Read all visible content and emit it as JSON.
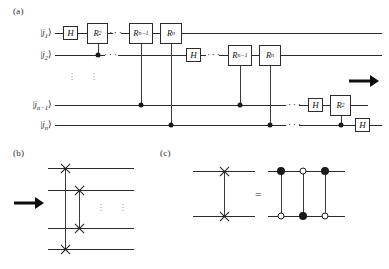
{
  "figure": {
    "panels": [
      {
        "id": "a",
        "label": "(a)"
      },
      {
        "id": "b",
        "label": "(b)"
      },
      {
        "id": "c",
        "label": "(c)"
      }
    ]
  },
  "panel_a": {
    "label": "(a)",
    "wires": [
      {
        "id": "j1",
        "label_html": "|<i>j</i><sub>1</sub>&#10217;",
        "y": 33
      },
      {
        "id": "j2",
        "label_html": "|<i>j</i><sub>2</sub>&#10217;",
        "y": 55
      },
      {
        "id": "jn1",
        "label_html": "|<i>j</i><sub>n&#8722;1</sub>&#10217;",
        "y": 105
      },
      {
        "id": "jn",
        "label_html": "|<i>j</i><sub>n</sub>&#10217;",
        "y": 125
      }
    ],
    "gates": [
      {
        "name": "h-gate-j1",
        "text_html": "H",
        "wire": "j1",
        "x": 63,
        "w": 15,
        "h": 14,
        "kind": "h"
      },
      {
        "name": "r2-gate-j1",
        "text_html": "R<sub>2</sub>",
        "wire": "j1",
        "x": 87,
        "w": 21,
        "h": 21,
        "kind": "r"
      },
      {
        "name": "rn-1-gate-j1",
        "text_html": "R<sub>n&#8722;1</sub>",
        "wire": "j1",
        "x": 129,
        "w": 24,
        "h": 21,
        "kind": "r"
      },
      {
        "name": "rn-gate-j1",
        "text_html": "R<sub>n</sub>",
        "wire": "j1",
        "x": 160,
        "w": 22,
        "h": 21,
        "kind": "r"
      },
      {
        "name": "h-gate-j2",
        "text_html": "H",
        "wire": "j2",
        "x": 186,
        "w": 15,
        "h": 14,
        "kind": "h"
      },
      {
        "name": "rn-1-gate-j2",
        "text_html": "R<sub>n&#8722;1</sub>",
        "wire": "j2",
        "x": 228,
        "w": 24,
        "h": 21,
        "kind": "r"
      },
      {
        "name": "rn-gate-j2",
        "text_html": "R<sub>n</sub>",
        "wire": "j2",
        "x": 259,
        "w": 22,
        "h": 21,
        "kind": "r"
      },
      {
        "name": "h-gate-jn-1",
        "text_html": "H",
        "wire": "jn1",
        "x": 308,
        "w": 15,
        "h": 14,
        "kind": "h"
      },
      {
        "name": "r2-gate-jn-1",
        "text_html": "R<sub>2</sub>",
        "wire": "jn1",
        "x": 330,
        "w": 21,
        "h": 21,
        "kind": "r"
      },
      {
        "name": "h-gate-jn",
        "text_html": "H",
        "wire": "jn",
        "x": 355,
        "w": 15,
        "h": 14,
        "kind": "h"
      }
    ],
    "controls": [
      {
        "name": "control-r2-j1",
        "x": 97.5,
        "wire": "j2"
      },
      {
        "name": "control-rn-1-j1",
        "x": 141,
        "wire": "jn1"
      },
      {
        "name": "control-rn-j1",
        "x": 171,
        "wire": "jn"
      },
      {
        "name": "control-rn-1-j2",
        "x": 240,
        "wire": "jn1"
      },
      {
        "name": "control-rn-j2",
        "x": 270,
        "wire": "jn"
      },
      {
        "name": "control-r2-jn-1",
        "x": 340.5,
        "wire": "jn"
      }
    ],
    "ellipses": [
      {
        "name": "h-ellipsis-j1",
        "text": "···",
        "x": 111,
        "y": 33
      },
      {
        "name": "h-ellipsis-j2",
        "text": "···",
        "x": 111,
        "y": 55
      },
      {
        "name": "h-ellipsis-j2b",
        "text": "···",
        "x": 210,
        "y": 55
      },
      {
        "name": "h-ellipsis-jn-1",
        "text": "···",
        "x": 292,
        "y": 105
      },
      {
        "name": "h-ellipsis-jn",
        "text": "···",
        "x": 292,
        "y": 125
      },
      {
        "name": "v-ellipsis-left",
        "text": "vdots",
        "x": 72,
        "y": 78
      },
      {
        "name": "v-ellipsis-right",
        "text": "vdots",
        "x": 94,
        "y": 78
      }
    ],
    "arrow": {
      "name": "flow-arrow-a",
      "x": 349,
      "y": 81,
      "length": 30
    }
  },
  "panel_b": {
    "label": "(b)",
    "wires_y": [
      168,
      190,
      228,
      249
    ],
    "swaps": [
      {
        "name": "swap-outer",
        "x": 65,
        "from_y": 168,
        "to_y": 249
      },
      {
        "name": "swap-inner",
        "x": 79,
        "from_y": 190,
        "to_y": 228
      }
    ],
    "ellipses": [
      {
        "name": "v-ellipsis-b-left",
        "x": 101,
        "y": 208
      },
      {
        "name": "v-ellipsis-b-right",
        "x": 123,
        "y": 208
      }
    ],
    "arrow": {
      "name": "flow-arrow-b",
      "x": 14,
      "y": 203,
      "length": 30
    }
  },
  "panel_c": {
    "label": "(c)",
    "wires_y": [
      171,
      216
    ],
    "swap": {
      "name": "swap-gate-c",
      "x": 224,
      "from_y": 171,
      "to_y": 216
    },
    "equals": {
      "name": "equals-sign",
      "text": "=",
      "x": 258,
      "y": 194
    },
    "cnots": [
      {
        "name": "cnot-1",
        "x": 278,
        "top": "filled",
        "bottom": "open"
      },
      {
        "name": "cnot-2",
        "x": 301,
        "top": "open",
        "bottom": "filled"
      },
      {
        "name": "cnot-3",
        "x": 324,
        "top": "filled",
        "bottom": "open"
      }
    ],
    "wire_x_start": 258,
    "wire_x_end": 345
  },
  "colors": {
    "ink": "#1a1a1a",
    "wire": "#2b2b2b",
    "arrow": "#0d0d0d",
    "background": "#ffffff"
  }
}
